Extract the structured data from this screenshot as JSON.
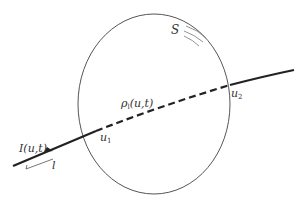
{
  "diagram": {
    "type": "surface-line-crossing",
    "labels": {
      "intensity": "I(u,t)",
      "length": "l",
      "entry_point": "u",
      "entry_sub": "1",
      "exit_point": "u",
      "exit_sub": "2",
      "density_main": "ρ",
      "density_sub": "l",
      "density_args": "(u,t)",
      "surface": "S"
    },
    "colors": {
      "line": "#222222",
      "circle": "#555555",
      "background": "#ffffff"
    }
  }
}
